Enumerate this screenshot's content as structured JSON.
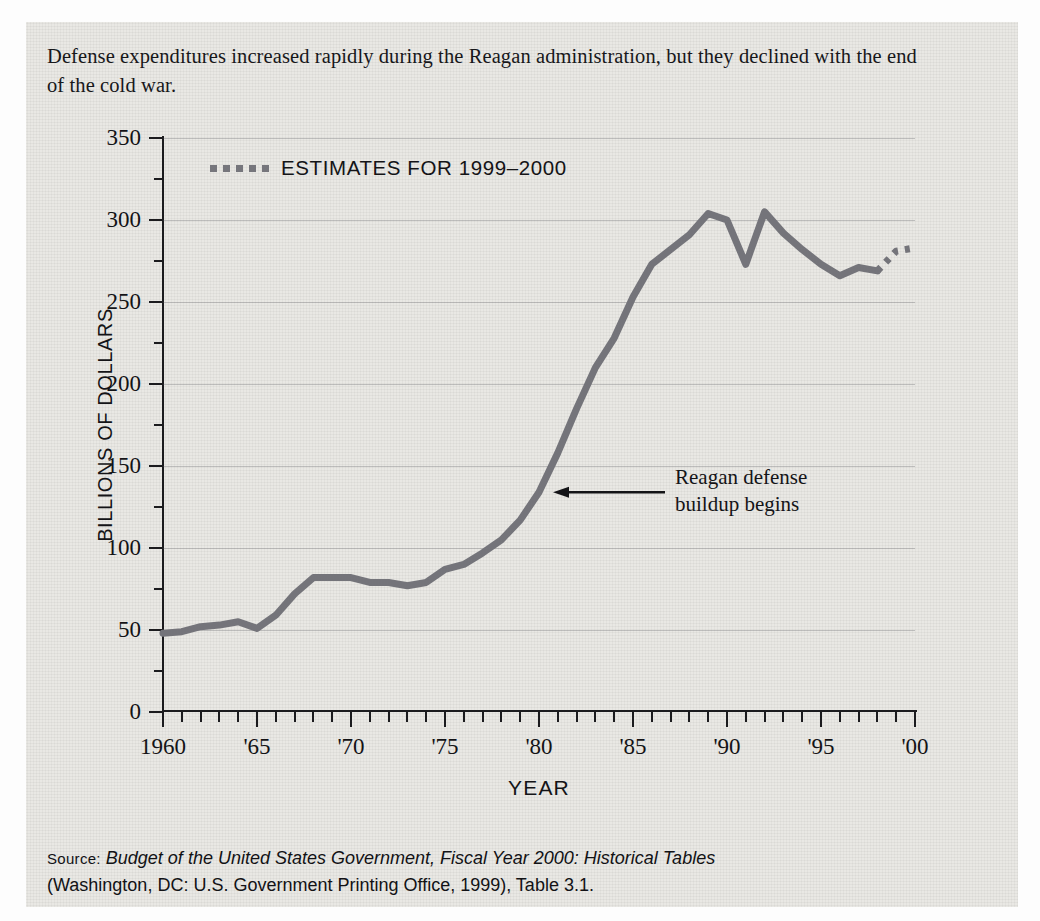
{
  "caption": "Defense expenditures increased rapidly during the Reagan administration, but they declined with the end of the cold war.",
  "legend": {
    "label": "ESTIMATES FOR 1999–2000",
    "swatch": "dotted-line-swatch"
  },
  "annotation": {
    "line1": "Reagan defense",
    "line2": "buildup begins",
    "arrow": "left-arrow-icon"
  },
  "source": {
    "prefix": "Source:",
    "italic_title": "Budget of the United States Government, Fiscal Year 2000: Historical Tables",
    "rest": "(Washington, DC: U.S. Government Printing Office, 1999), Table 3.1."
  },
  "colors": {
    "line": "#74747a",
    "axis": "#1b1b1e",
    "text": "#141417",
    "background": "#e9e8e4",
    "grid": "rgba(90,90,95,0.30)"
  },
  "chart_data": {
    "type": "line",
    "title": "",
    "xlabel": "YEAR",
    "ylabel": "BILLIONS OF DOLLARS",
    "xlim": [
      1960,
      2000
    ],
    "ylim": [
      0,
      350
    ],
    "ytick_step": 50,
    "yminor_step": 25,
    "xtick_step": 1,
    "grid": true,
    "legend_position": "top-left-inside",
    "ytick_labels": [
      "0",
      "50",
      "100",
      "150",
      "200",
      "250",
      "300",
      "350"
    ],
    "ytick_values": [
      0,
      50,
      100,
      150,
      200,
      250,
      300,
      350
    ],
    "xtick_labels": [
      "1960",
      "'65",
      "'70",
      "'75",
      "'80",
      "'85",
      "'90",
      "'95",
      "'00"
    ],
    "xtick_values": [
      1960,
      1965,
      1970,
      1975,
      1980,
      1985,
      1990,
      1995,
      2000
    ],
    "series": [
      {
        "name": "Defense expenditures (actual)",
        "style": "solid",
        "x": [
          1960,
          1961,
          1962,
          1963,
          1964,
          1965,
          1966,
          1967,
          1968,
          1969,
          1970,
          1971,
          1972,
          1973,
          1974,
          1975,
          1976,
          1977,
          1978,
          1979,
          1980,
          1981,
          1982,
          1983,
          1984,
          1985,
          1986,
          1987,
          1988,
          1989,
          1990,
          1991,
          1992,
          1993,
          1994,
          1995,
          1996,
          1997,
          1998
        ],
        "values": [
          48,
          49,
          52,
          53,
          55,
          51,
          59,
          72,
          82,
          82,
          82,
          79,
          79,
          77,
          79,
          87,
          90,
          97,
          105,
          117,
          134,
          158,
          185,
          210,
          228,
          253,
          273,
          282,
          291,
          304,
          300,
          273,
          305,
          292,
          282,
          273,
          266,
          271,
          269
        ]
      },
      {
        "name": "Defense expenditures (estimates 1999–2000)",
        "style": "dotted",
        "x": [
          1998,
          1999,
          2000
        ],
        "values": [
          269,
          281,
          283
        ]
      }
    ],
    "annotations": [
      {
        "text": "Reagan defense buildup begins",
        "x": 1980,
        "y": 134,
        "arrow": "left"
      }
    ]
  }
}
